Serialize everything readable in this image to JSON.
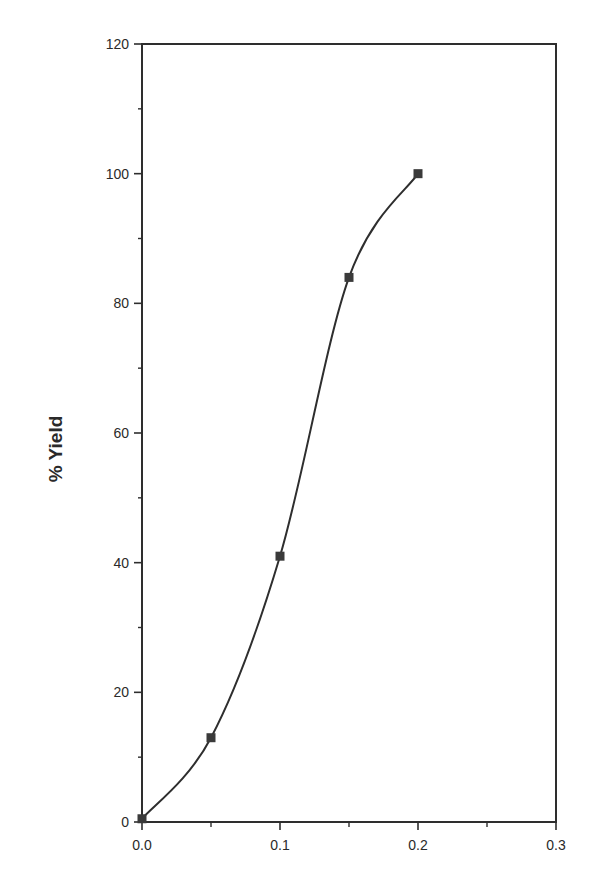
{
  "chart_data": {
    "type": "line",
    "title": "",
    "xlabel": "",
    "ylabel": "% Yield",
    "xlim": [
      0.0,
      0.3
    ],
    "ylim": [
      0,
      120
    ],
    "x_ticks": [
      "0.0",
      "0.1",
      "0.2",
      "0.3"
    ],
    "x_tick_values": [
      0.0,
      0.1,
      0.2,
      0.3
    ],
    "x_minor_ticks": [
      0.05,
      0.15,
      0.25
    ],
    "y_ticks": [
      "0",
      "20",
      "40",
      "60",
      "80",
      "100",
      "120"
    ],
    "y_tick_values": [
      0,
      20,
      40,
      60,
      80,
      100,
      120
    ],
    "y_minor_ticks": [
      10,
      30,
      50,
      70,
      90,
      110
    ],
    "grid": false,
    "legend": null,
    "marker": "square",
    "line_style": "smooth",
    "series": [
      {
        "name": "% Yield",
        "x": [
          0.0,
          0.05,
          0.1,
          0.15,
          0.2
        ],
        "y": [
          0.5,
          13,
          41,
          84,
          100
        ]
      }
    ]
  },
  "colors": {
    "line": "#2e2e2e",
    "marker": "#3a3a3a",
    "axis": "#2e2e2e",
    "background": "#ffffff"
  }
}
